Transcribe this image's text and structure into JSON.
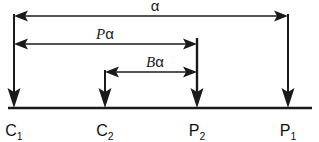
{
  "diagram": {
    "colors": {
      "stroke": "#1a1a1a",
      "background": "#ffffff",
      "label": "#111111"
    },
    "baseline": {
      "name": "baseline",
      "y": 108,
      "x_start": 8,
      "x_end": 312
    },
    "markers": [
      {
        "id": "c1",
        "label_base": "C",
        "label_sub": "1",
        "x": 14,
        "top_y": 14,
        "label_x": 14,
        "label_y": 136
      },
      {
        "id": "c2",
        "label_base": "C",
        "label_sub": "2",
        "x": 105,
        "top_y": 70,
        "label_x": 105,
        "label_y": 136
      },
      {
        "id": "p2",
        "label_base": "P",
        "label_sub": "2",
        "x": 197,
        "top_y": 38,
        "label_x": 197,
        "label_y": 136
      },
      {
        "id": "p1",
        "label_base": "P",
        "label_sub": "1",
        "x": 288,
        "top_y": 14,
        "label_x": 288,
        "label_y": 136
      }
    ],
    "dimensions": [
      {
        "id": "alpha",
        "label_var": "",
        "label_alpha": "α",
        "y": 16,
        "x_from": 14,
        "x_to": 288,
        "label_x": 155,
        "label_y": 11,
        "from_marker": "c1",
        "to_marker": "p1"
      },
      {
        "id": "p-alpha",
        "label_var": "P",
        "label_alpha": "α",
        "y": 44,
        "x_from": 14,
        "x_to": 197,
        "label_x": 105,
        "label_y": 39,
        "from_marker": "c1",
        "to_marker": "p2"
      },
      {
        "id": "b-alpha",
        "label_var": "B",
        "label_alpha": "α",
        "y": 72,
        "x_from": 105,
        "x_to": 197,
        "label_x": 155,
        "label_y": 67,
        "from_marker": "c2",
        "to_marker": "p2"
      }
    ]
  }
}
